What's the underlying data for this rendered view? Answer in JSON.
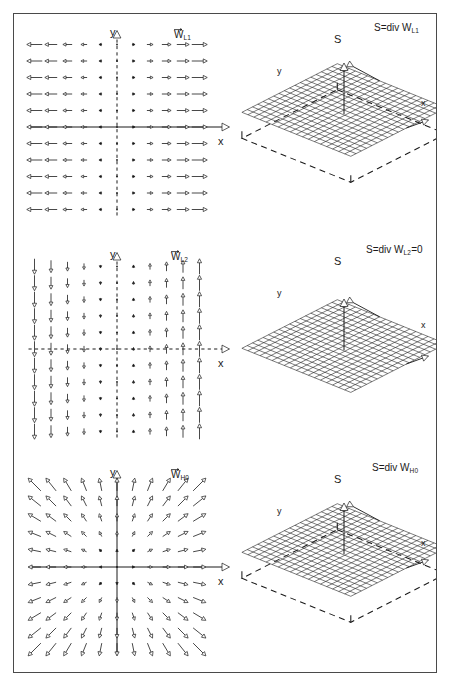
{
  "figure": {
    "width": 451,
    "height": 687,
    "background": "#ffffff",
    "border_color": "#4a4a4a",
    "line_color": "#1a1a1a",
    "mesh_color": "#2b2b2b"
  },
  "panels": [
    {
      "id": "panel-L1",
      "field": {
        "name": "vector-field-WL1",
        "label": "W",
        "label_subscript": "L1",
        "axis_x_label": "x",
        "axis_y_label": "y",
        "type": "horizontal-diverging",
        "grid_cols": 11,
        "grid_rows": 11,
        "description": "arrows horizontal, length proportional to |x|, pointing away from y-axis"
      },
      "surface": {
        "name": "divergence-surface-L1",
        "label": "S=div W",
        "label_subscript": "L1",
        "label_suffix": "",
        "axis_s_label": "S",
        "axis_x_label": "x",
        "axis_y_label": "y",
        "type": "flat-elevated-mesh",
        "mesh_cols": 18,
        "mesh_rows": 18,
        "has_reference_box": true,
        "elevation": 1
      }
    },
    {
      "id": "panel-L2",
      "field": {
        "name": "vector-field-WL2",
        "label": "W",
        "label_subscript": "L2",
        "axis_x_label": "x",
        "axis_y_label": "y",
        "type": "vertical-shear",
        "grid_cols": 11,
        "grid_rows": 11,
        "description": "arrows vertical, down for x<0 and up for x>0, length proportional to |x|"
      },
      "surface": {
        "name": "divergence-surface-L2",
        "label": "S=div W",
        "label_subscript": "L2",
        "label_suffix": "=0",
        "axis_s_label": "S",
        "axis_x_label": "x",
        "axis_y_label": "y",
        "type": "flat-zero-mesh",
        "mesh_cols": 18,
        "mesh_rows": 18,
        "has_reference_box": false,
        "elevation": 0
      }
    },
    {
      "id": "panel-H0",
      "field": {
        "name": "vector-field-WH0",
        "label": "W",
        "label_subscript": "H0",
        "axis_x_label": "x",
        "axis_y_label": "y",
        "type": "radial-source",
        "grid_cols": 11,
        "grid_rows": 11,
        "description": "arrows radiate outward from origin, length proportional to radius"
      },
      "surface": {
        "name": "divergence-surface-H0",
        "label": "S=div W",
        "label_subscript": "H0",
        "label_suffix": "",
        "axis_s_label": "S",
        "axis_x_label": "x",
        "axis_y_label": "y",
        "type": "flat-elevated-mesh",
        "mesh_cols": 18,
        "mesh_rows": 18,
        "has_reference_box": true,
        "elevation": 1
      }
    }
  ],
  "chart_data": {
    "type": "vector-field-and-surface",
    "title": "",
    "panels": [
      {
        "field_name": "W_L1",
        "field_type": "horizontal diverging",
        "vector_formula": "W = (k*x, 0)",
        "divergence_label": "S=div W_L1",
        "divergence_value": "constant positive",
        "grid": {
          "cols": 11,
          "rows": 11,
          "x": [
            -5,
            -4,
            -3,
            -2,
            -1,
            0,
            1,
            2,
            3,
            4,
            5
          ],
          "y": [
            5,
            4,
            3,
            2,
            1,
            0,
            -1,
            -2,
            -3,
            -4,
            -5
          ]
        }
      },
      {
        "field_name": "W_L2",
        "field_type": "vertical shear",
        "vector_formula": "W = (0, k*x)",
        "divergence_label": "S=div W_L2=0",
        "divergence_value": "0",
        "grid": {
          "cols": 11,
          "rows": 11,
          "x": [
            -5,
            -4,
            -3,
            -2,
            -1,
            0,
            1,
            2,
            3,
            4,
            5
          ],
          "y": [
            5,
            4,
            3,
            2,
            1,
            0,
            -1,
            -2,
            -3,
            -4,
            -5
          ]
        }
      },
      {
        "field_name": "W_H0",
        "field_type": "radial source",
        "vector_formula": "W = k*(x, y)",
        "divergence_label": "S=div W_H0",
        "divergence_value": "constant positive",
        "grid": {
          "cols": 11,
          "rows": 11,
          "x": [
            -5,
            -4,
            -3,
            -2,
            -1,
            0,
            1,
            2,
            3,
            4,
            5
          ],
          "y": [
            5,
            4,
            3,
            2,
            1,
            0,
            -1,
            -2,
            -3,
            -4,
            -5
          ]
        }
      }
    ],
    "axes": {
      "xlabel": "x",
      "ylabel": "y",
      "zlabel": "S"
    }
  }
}
